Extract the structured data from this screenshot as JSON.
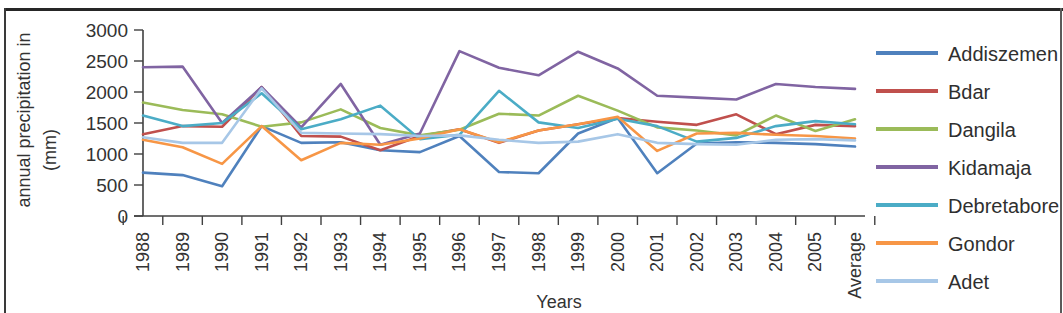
{
  "chart_data": {
    "type": "line",
    "title": "",
    "xlabel": "Years",
    "ylabel": "annual precipitation in (mm)",
    "ylabel_line1": "annual precipitation in",
    "ylabel_line2": "(mm)",
    "ylim": [
      0,
      3000
    ],
    "ytick_step": 500,
    "yticks": [
      0,
      500,
      1000,
      1500,
      2000,
      2500,
      3000
    ],
    "ytick_labels": [
      "0",
      "500",
      "1000",
      "1500",
      "2000",
      "2500",
      "3000"
    ],
    "grid": false,
    "legend_position": "right",
    "categories": [
      "1988",
      "1989",
      "1990",
      "1991",
      "1992",
      "1993",
      "1994",
      "1995",
      "1996",
      "1997",
      "1998",
      "1999",
      "2000",
      "2001",
      "2002",
      "2003",
      "2004",
      "2005",
      "Average"
    ],
    "series": [
      {
        "name": "Addiszemen",
        "color": "#4F81BD",
        "values": [
          700,
          660,
          480,
          1450,
          1180,
          1190,
          1060,
          1030,
          1290,
          710,
          690,
          1330,
          1580,
          690,
          1170,
          1190,
          1180,
          1160,
          1120
        ]
      },
      {
        "name": "Bdar",
        "color": "#C0504D",
        "values": [
          1320,
          1450,
          1440,
          2080,
          1290,
          1280,
          1060,
          1290,
          1400,
          1180,
          1380,
          1480,
          1580,
          1520,
          1470,
          1640,
          1320,
          1470,
          1450
        ]
      },
      {
        "name": "Dangila",
        "color": "#9BBB59",
        "values": [
          1830,
          1710,
          1640,
          1440,
          1510,
          1720,
          1420,
          1300,
          1390,
          1650,
          1620,
          1940,
          1700,
          1430,
          1380,
          1300,
          1620,
          1370,
          1560
        ]
      },
      {
        "name": "Kidamaja",
        "color": "#8064A2",
        "values": [
          2400,
          2410,
          1500,
          2080,
          1430,
          2130,
          1150,
          1330,
          2660,
          2390,
          2270,
          2650,
          2380,
          1940,
          1910,
          1880,
          2130,
          2080,
          2050
        ]
      },
      {
        "name": "Debretabore",
        "color": "#4BACC6",
        "values": [
          1620,
          1450,
          1500,
          1980,
          1400,
          1560,
          1780,
          1240,
          1310,
          2020,
          1510,
          1420,
          1570,
          1450,
          1200,
          1260,
          1450,
          1530,
          1480
        ]
      },
      {
        "name": "Gondor",
        "color": "#F79646",
        "values": [
          1230,
          1110,
          840,
          1450,
          900,
          1180,
          1150,
          1250,
          1400,
          1190,
          1380,
          1480,
          1600,
          1050,
          1330,
          1340,
          1310,
          1290,
          1250
        ]
      },
      {
        "name": "Adet",
        "color": "#A7C7E7",
        "values": [
          1270,
          1180,
          1180,
          2060,
          1340,
          1330,
          1320,
          1290,
          1300,
          1230,
          1180,
          1200,
          1320,
          1180,
          1160,
          1150,
          1230,
          1240,
          1220
        ]
      }
    ]
  }
}
